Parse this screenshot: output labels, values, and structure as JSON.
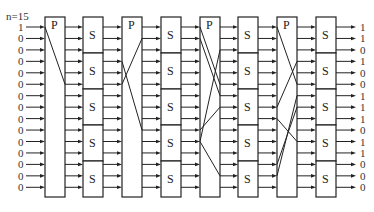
{
  "diagram": {
    "n_label": "n=15",
    "n": 15,
    "inputs": [
      "1",
      "0",
      "0",
      "0",
      "0",
      "0",
      "0",
      "0",
      "0",
      "0",
      "0",
      "0",
      "0",
      "0",
      "0"
    ],
    "outputs": [
      "1",
      "1",
      "0",
      "1",
      "0",
      "0",
      "1",
      "1",
      "1",
      "0",
      "1",
      "1",
      "0",
      "0",
      "0"
    ],
    "stages": [
      {
        "type": "P",
        "label": "P",
        "mapping": [
          [
            1,
            6
          ]
        ]
      },
      {
        "type": "S",
        "label": "S",
        "boxes": 5,
        "bits_per_box": 3
      },
      {
        "type": "P",
        "label": "P",
        "mapping": [
          [
            6,
            2
          ],
          [
            4,
            10
          ]
        ]
      },
      {
        "type": "S",
        "label": "S",
        "boxes": 5,
        "bits_per_box": 3
      },
      {
        "type": "P",
        "label": "P",
        "mapping": [
          [
            1,
            6
          ],
          [
            2,
            7
          ],
          [
            11,
            3
          ],
          [
            10,
            8
          ],
          [
            11,
            14
          ]
        ]
      },
      {
        "type": "S",
        "label": "S",
        "boxes": 5,
        "bits_per_box": 3
      },
      {
        "type": "P",
        "label": "P",
        "mapping": [
          [
            1,
            6
          ],
          [
            8,
            4
          ],
          [
            9,
            11
          ],
          [
            13,
            8
          ],
          [
            14,
            7
          ]
        ]
      },
      {
        "type": "S",
        "label": "S",
        "boxes": 5,
        "bits_per_box": 3
      }
    ],
    "colors": {
      "stroke": "#222222",
      "text": "#333333",
      "background": "#ffffff"
    }
  }
}
